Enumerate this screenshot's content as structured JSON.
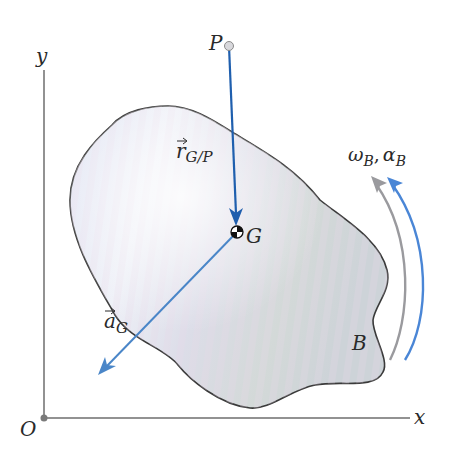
{
  "diagram": {
    "type": "rigid-body-kinematics",
    "axes": {
      "x_label": "x",
      "y_label": "y",
      "origin_label": "O",
      "color": "#6e6e6e"
    },
    "body": {
      "label": "B",
      "outline_color": "#3a3a3a",
      "fill_colors": [
        "#e4e8f3",
        "#d9dce6",
        "#cfd6d4"
      ]
    },
    "points": {
      "P": {
        "label": "P"
      },
      "G": {
        "label": "G"
      }
    },
    "vectors": {
      "r_GP": {
        "symbol": "r",
        "subscript": "G/P",
        "color": "#1f5fae"
      },
      "a_G": {
        "symbol": "a",
        "subscript": "G",
        "color": "#4a86c8"
      }
    },
    "rotation": {
      "omega": "ω",
      "omega_sub": "B",
      "separator": ",",
      "alpha": "α",
      "alpha_sub": "B",
      "omega_arc_color": "#9a9a9e",
      "alpha_arc_color": "#4a86d6"
    }
  }
}
